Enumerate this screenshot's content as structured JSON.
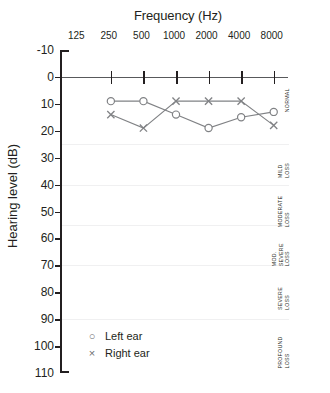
{
  "chart_data": {
    "type": "line",
    "title": "Frequency (Hz)",
    "xlabel": "Frequency (Hz)",
    "ylabel": "Hearing level (dB)",
    "categories": [
      "125",
      "250",
      "500",
      "1000",
      "2000",
      "4000",
      "8000"
    ],
    "x_tick_labels": [
      "125",
      "250",
      "500",
      "1000",
      "2000",
      "4000",
      "8000"
    ],
    "y_tick_labels": [
      "-10",
      "0",
      "10",
      "20",
      "30",
      "40",
      "50",
      "60",
      "70",
      "80",
      "90",
      "100",
      "110"
    ],
    "ylim": [
      -10,
      110
    ],
    "y_inverted": true,
    "grid": false,
    "legend_position": "inside-bottom-left",
    "series": [
      {
        "name": "Left ear",
        "marker": "circle",
        "color": "#808285",
        "x": [
          "250",
          "500",
          "1000",
          "2000",
          "4000",
          "8000"
        ],
        "values": [
          9,
          9,
          14,
          19,
          15,
          13
        ]
      },
      {
        "name": "Right ear",
        "marker": "x",
        "color": "#808285",
        "x": [
          "250",
          "500",
          "1000",
          "2000",
          "4000",
          "8000"
        ],
        "values": [
          14,
          19,
          9,
          9,
          9,
          18
        ]
      }
    ],
    "severity_bands": [
      {
        "label_lines": [
          "NORMAL"
        ],
        "from": -10,
        "to": 25
      },
      {
        "label_lines": [
          "MILD",
          "LOSS"
        ],
        "from": 25,
        "to": 40
      },
      {
        "label_lines": [
          "MODERATE",
          "LOSS"
        ],
        "from": 40,
        "to": 55
      },
      {
        "label_lines": [
          "MOD.",
          "SEVERE",
          "LOSS"
        ],
        "from": 55,
        "to": 70
      },
      {
        "label_lines": [
          "SEVERE",
          "LOSS"
        ],
        "from": 70,
        "to": 90
      },
      {
        "label_lines": [
          "PROFOUND",
          "LOSS"
        ],
        "from": 90,
        "to": 110
      }
    ]
  },
  "legend": {
    "items": [
      {
        "mark": "circle-marker",
        "label": "Left ear"
      },
      {
        "mark": "x-marker",
        "label": "Right ear"
      }
    ]
  }
}
